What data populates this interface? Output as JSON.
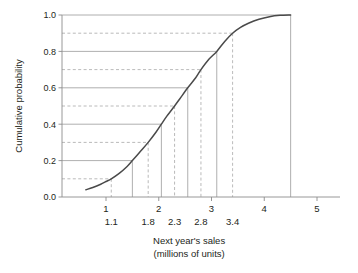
{
  "chart_data": {
    "type": "line",
    "title": "",
    "xlabel_line1": "Next year's sales",
    "xlabel_line2": "(millions of units)",
    "ylabel": "Cumulative probability",
    "xlim": [
      0.45,
      5.3
    ],
    "ylim": [
      0.0,
      1.0
    ],
    "grid": "partial-horizontal-and-vertical-leader-lines",
    "legend": "none",
    "x_major_ticks": [
      "1",
      "2",
      "3",
      "4",
      "5"
    ],
    "x_major_values": [
      1,
      2,
      3,
      4,
      5
    ],
    "y_ticks": [
      "0.0",
      "0.2",
      "0.4",
      "0.6",
      "0.8",
      "1.0"
    ],
    "y_values": [
      0.0,
      0.2,
      0.4,
      0.6,
      0.8,
      1.0
    ],
    "x_minor_labels": [
      "1.1",
      "1.8",
      "2.3",
      "2.8",
      "3.4"
    ],
    "x_minor_values": [
      1.1,
      1.8,
      2.3,
      2.8,
      3.4
    ],
    "solid_leaders": [
      {
        "x": 1.5,
        "y": 0.2
      },
      {
        "x": 2.05,
        "y": 0.4
      },
      {
        "x": 2.55,
        "y": 0.6
      },
      {
        "x": 3.1,
        "y": 0.8
      }
    ],
    "dashed_leaders": [
      {
        "x": 1.1,
        "y": 0.1
      },
      {
        "x": 1.8,
        "y": 0.3
      },
      {
        "x": 2.3,
        "y": 0.5
      },
      {
        "x": 2.8,
        "y": 0.7
      },
      {
        "x": 3.4,
        "y": 0.9
      }
    ],
    "curve_end": {
      "x": 4.5,
      "y": 1.0
    },
    "curve_start": {
      "x": 0.62,
      "y": 0.04
    },
    "series": [
      {
        "name": "Cumulative distribution",
        "points": [
          [
            0.62,
            0.04
          ],
          [
            0.75,
            0.052
          ],
          [
            0.9,
            0.07
          ],
          [
            1.0,
            0.085
          ],
          [
            1.1,
            0.1
          ],
          [
            1.25,
            0.13
          ],
          [
            1.4,
            0.168
          ],
          [
            1.5,
            0.2
          ],
          [
            1.65,
            0.25
          ],
          [
            1.8,
            0.3
          ],
          [
            1.95,
            0.357
          ],
          [
            2.05,
            0.4
          ],
          [
            2.15,
            0.443
          ],
          [
            2.3,
            0.5
          ],
          [
            2.4,
            0.54
          ],
          [
            2.55,
            0.6
          ],
          [
            2.7,
            0.655
          ],
          [
            2.8,
            0.7
          ],
          [
            2.95,
            0.757
          ],
          [
            3.1,
            0.8
          ],
          [
            3.25,
            0.855
          ],
          [
            3.4,
            0.9
          ],
          [
            3.55,
            0.932
          ],
          [
            3.7,
            0.955
          ],
          [
            3.9,
            0.977
          ],
          [
            4.1,
            0.991
          ],
          [
            4.3,
            0.998
          ],
          [
            4.5,
            1.0
          ]
        ]
      }
    ]
  },
  "colors": {
    "curve": "#4a4a4a",
    "axis": "#8c8c8c",
    "leader_solid": "#9a9a9a",
    "leader_dashed": "#a8a8a8",
    "text": "#231f20"
  }
}
